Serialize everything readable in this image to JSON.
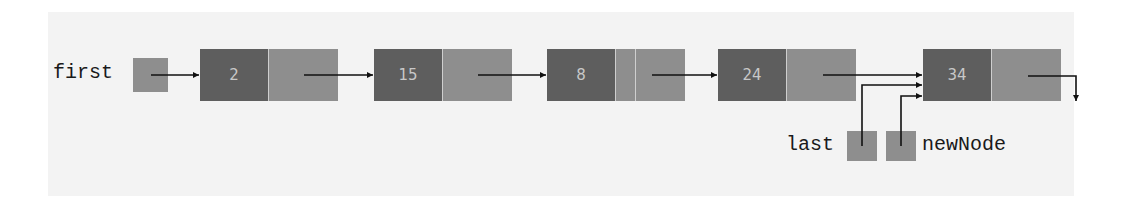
{
  "diagram": {
    "type": "singly-linked-list",
    "pointers": {
      "first": {
        "label": "first"
      },
      "last": {
        "label": "last"
      },
      "newNode": {
        "label": "newNode"
      }
    },
    "nodes": [
      {
        "info": "2"
      },
      {
        "info": "15"
      },
      {
        "info": "8"
      },
      {
        "info": "24"
      },
      {
        "info": "34"
      }
    ],
    "colors": {
      "data_cell": "#5e5e5e",
      "link_cell": "#8e8e8e",
      "background": "#f3f3f3",
      "arrow": "#111111"
    }
  }
}
